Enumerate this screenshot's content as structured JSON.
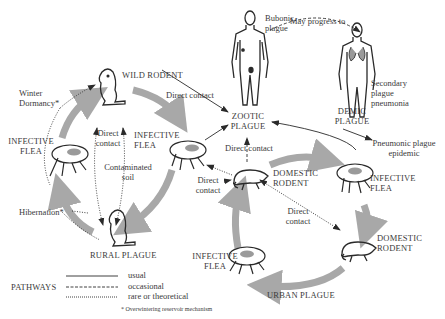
{
  "diagram": {
    "colors": {
      "arrow_gray": "#a8a8a8",
      "line": "#2a2a2a",
      "text": "#3a3a3a",
      "background": "#ffffff"
    },
    "nodes": {
      "wild_rodent": "WILD RODENT",
      "infective_flea_left_1": "INFECTIVE",
      "infective_flea_left_2": "FLEA",
      "infective_flea_mid_1": "INFECTIVE",
      "infective_flea_mid_2": "FLEA",
      "rural_plague": "RURAL PLAGUE",
      "zootic_plague_1": "ZOOTIC",
      "zootic_plague_2": "PLAGUE",
      "demic_plague_1": "DEMIC",
      "demic_plague_2": "PLAGUE",
      "domestic_rodent_top_1": "DOMESTIC",
      "domestic_rodent_top_2": "RODENT",
      "domestic_rodent_right_1": "DOMESTIC",
      "domestic_rodent_right_2": "RODENT",
      "infective_flea_right_1": "INFECTIVE",
      "infective_flea_right_2": "FLEA",
      "infective_flea_bottom_1": "INFECTIVE",
      "infective_flea_bottom_2": "FLEA",
      "urban_plague": "URBAN PLAGUE"
    },
    "annotations": {
      "winter_dormancy_1": "Winter",
      "winter_dormancy_2": "Dormancy*",
      "hibernation": "Hibernation*",
      "direct_contact_wild_1": "Direct",
      "direct_contact_wild_2": "contact",
      "contaminated_soil_1": "Contaminated",
      "contaminated_soil_2": "soil",
      "direct_contact_top": "Direct contact",
      "direct_contact_zootic": "Direct contact",
      "direct_contact_left_1": "Direct",
      "direct_contact_left_2": "contact",
      "direct_contact_urban_1": "Direct",
      "direct_contact_urban_2": "contact",
      "bubonic_plague_1": "Bubonic",
      "bubonic_plague_2": "plague",
      "may_progress_to": "May progress to",
      "secondary_pneumonia_1": "Secondary",
      "secondary_pneumonia_2": "plague",
      "secondary_pneumonia_3": "pneumonia",
      "pneumonic_epidemic_1": "Pneumonic plague",
      "pneumonic_epidemic_2": "epidemic"
    },
    "legend": {
      "title": "PATHWAYS",
      "items": [
        {
          "style": "solid",
          "label": "usual"
        },
        {
          "style": "dashed",
          "label": "occasional"
        },
        {
          "style": "dotted",
          "label": "rare or theoretical"
        }
      ],
      "footnote": "* Overwintering reservoir mechanism"
    }
  }
}
